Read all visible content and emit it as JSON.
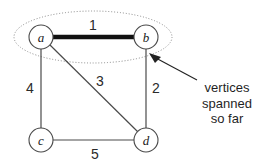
{
  "diagram": {
    "vertices": [
      {
        "id": "a",
        "label": "a",
        "cx": 41,
        "cy": 37,
        "r": 12
      },
      {
        "id": "b",
        "label": "b",
        "cx": 146,
        "cy": 37,
        "r": 12
      },
      {
        "id": "c",
        "label": "c",
        "cx": 41,
        "cy": 140,
        "r": 12
      },
      {
        "id": "d",
        "label": "d",
        "cx": 146,
        "cy": 140,
        "r": 12
      }
    ],
    "edges": [
      {
        "id": "ab",
        "from": "a",
        "to": "b",
        "weight": "1",
        "selected": true,
        "x1": 53,
        "y1": 37,
        "x2": 134,
        "y2": 37,
        "label_x": 93,
        "label_y": 25
      },
      {
        "id": "ac",
        "from": "a",
        "to": "c",
        "weight": "4",
        "selected": false,
        "x1": 41,
        "y1": 49,
        "x2": 41,
        "y2": 128,
        "label_x": 30,
        "label_y": 88
      },
      {
        "id": "bd",
        "from": "b",
        "to": "d",
        "weight": "2",
        "selected": false,
        "x1": 146,
        "y1": 49,
        "x2": 146,
        "y2": 128,
        "label_x": 156,
        "label_y": 88
      },
      {
        "id": "ad",
        "from": "a",
        "to": "d",
        "weight": "3",
        "selected": false,
        "x1": 50,
        "y1": 45,
        "x2": 138,
        "y2": 132,
        "label_x": 100,
        "label_y": 81
      },
      {
        "id": "cd",
        "from": "c",
        "to": "d",
        "weight": "5",
        "selected": false,
        "x1": 53,
        "y1": 140,
        "x2": 134,
        "y2": 140,
        "label_x": 95,
        "label_y": 154
      }
    ],
    "span_region": {
      "name": "vertices-spanned-ellipse",
      "cx": 93,
      "cy": 37,
      "rx": 79,
      "ry": 26
    },
    "annotation": {
      "lines": [
        "vertices",
        "spanned",
        "so far"
      ],
      "leader": {
        "x1": 197,
        "y1": 80,
        "x2": 153,
        "y2": 56
      },
      "arrow_tip": {
        "x": 150,
        "y": 54
      }
    },
    "colors": {
      "selected_edge": "#111111",
      "edge": "#4a4a4a",
      "vertex_stroke": "#4a4a4a",
      "ellipse": "#8a8a8a",
      "text": "#1f1f1f",
      "background": "#ffffff"
    }
  }
}
